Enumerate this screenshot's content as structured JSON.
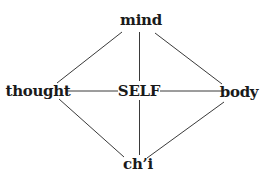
{
  "diagram": {
    "type": "concept-graph",
    "nodes": {
      "mind": {
        "label": "mind"
      },
      "thought": {
        "label": "thought"
      },
      "self": {
        "label": "SELF"
      },
      "body": {
        "label": "body"
      },
      "chi": {
        "label": "ch’i"
      }
    },
    "edges": [
      {
        "from": "mind",
        "to": "thought"
      },
      {
        "from": "mind",
        "to": "body"
      },
      {
        "from": "mind",
        "to": "self"
      },
      {
        "from": "thought",
        "to": "self"
      },
      {
        "from": "self",
        "to": "body"
      },
      {
        "from": "self",
        "to": "chi"
      },
      {
        "from": "thought",
        "to": "chi"
      },
      {
        "from": "body",
        "to": "chi"
      }
    ],
    "colors": {
      "line": "#3a3a3a",
      "text": "#1a1a1a",
      "background": "#ffffff"
    }
  }
}
